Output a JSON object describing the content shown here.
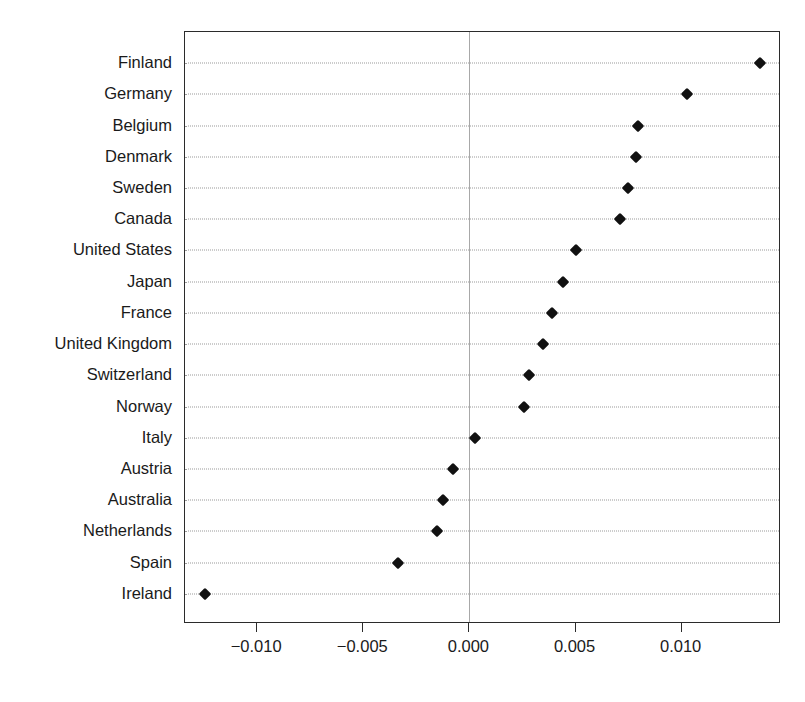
{
  "chart_data": {
    "type": "scatter",
    "subtype": "dot-plot",
    "title": "",
    "subtitle": "",
    "xlabel": "",
    "ylabel": "",
    "orientation": "horizontal",
    "grid": "horizontal-dotted",
    "legend": "none",
    "zero_reference_line": true,
    "xlim": [
      -0.0134,
      0.01468
    ],
    "xticks": [
      -0.01,
      -0.005,
      0.0,
      0.005,
      0.01
    ],
    "xticklabels": [
      "−0.010",
      "−0.005",
      "0.000",
      "0.005",
      "0.010"
    ],
    "categories": [
      "Finland",
      "Germany",
      "Belgium",
      "Denmark",
      "Sweden",
      "Canada",
      "United States",
      "Japan",
      "France",
      "United Kingdom",
      "Switzerland",
      "Norway",
      "Italy",
      "Austria",
      "Australia",
      "Netherlands",
      "Spain",
      "Ireland"
    ],
    "values": [
      0.01368,
      0.01024,
      0.00792,
      0.00783,
      0.00745,
      0.00708,
      0.005,
      0.00443,
      0.00387,
      0.00349,
      0.00283,
      0.00255,
      0.00024,
      -0.00075,
      -0.00123,
      -0.00151,
      -0.00335,
      -0.01245
    ],
    "marker": "diamond",
    "marker_color": "#111111"
  },
  "colors": {
    "marker": "#111111",
    "frame": "#2b2b2b",
    "grid": "#9a9a9a",
    "zero_line": "#a8a8a8",
    "text": "#1a1a1a",
    "background": "#ffffff"
  }
}
